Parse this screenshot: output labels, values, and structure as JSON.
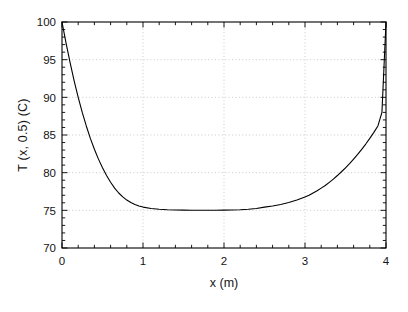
{
  "chart_data": {
    "type": "line",
    "title": "",
    "xlabel": "x (m)",
    "ylabel": "T (x, 0.5) (C)",
    "xlim": [
      0,
      4
    ],
    "ylim": [
      70,
      100
    ],
    "xticks": [
      0,
      1,
      2,
      3,
      4
    ],
    "xtick_labels": [
      "0",
      "1",
      "2",
      "3",
      "4"
    ],
    "yticks": [
      70,
      75,
      80,
      85,
      90,
      95,
      100
    ],
    "ytick_labels": [
      "70",
      "75",
      "80",
      "85",
      "90",
      "95",
      "100"
    ],
    "x_minor_ticks_between": 4,
    "y_minor_ticks_between": 4,
    "grid": true,
    "grid_style": "dotted",
    "grid_color": "#bdbdbd",
    "legend": "none",
    "line_color": "#000000",
    "line_width": 1.1,
    "frame_color": "#000000",
    "background": "#ffffff",
    "series": [
      {
        "name": "T(x, 0.5)",
        "x": [
          0.0,
          0.05,
          0.1,
          0.15,
          0.2,
          0.25,
          0.3,
          0.35,
          0.4,
          0.45,
          0.5,
          0.55,
          0.6,
          0.65,
          0.7,
          0.75,
          0.8,
          0.85,
          0.9,
          0.95,
          1.0,
          1.1,
          1.2,
          1.3,
          1.4,
          1.5,
          1.6,
          1.7,
          1.8,
          1.9,
          2.0,
          2.1,
          2.2,
          2.3,
          2.4,
          2.5,
          2.6,
          2.7,
          2.8,
          2.9,
          3.0,
          3.05,
          3.1,
          3.15,
          3.2,
          3.25,
          3.3,
          3.35,
          3.4,
          3.45,
          3.5,
          3.55,
          3.6,
          3.65,
          3.7,
          3.75,
          3.8,
          3.85,
          3.9,
          3.95,
          4.0
        ],
        "y": [
          100.0,
          97.2,
          94.6,
          92.2,
          90.0,
          88.0,
          86.2,
          84.55,
          83.1,
          81.8,
          80.65,
          79.62,
          78.72,
          77.95,
          77.3,
          76.78,
          76.36,
          76.03,
          75.78,
          75.58,
          75.43,
          75.24,
          75.14,
          75.08,
          75.05,
          75.03,
          75.02,
          75.02,
          75.02,
          75.02,
          75.03,
          75.05,
          75.08,
          75.14,
          75.24,
          75.43,
          75.58,
          75.78,
          76.03,
          76.36,
          76.78,
          77.0,
          77.3,
          77.6,
          77.95,
          78.3,
          78.72,
          79.15,
          79.62,
          80.12,
          80.65,
          81.2,
          81.8,
          82.42,
          83.1,
          83.8,
          84.55,
          85.35,
          86.2,
          88.0,
          100.0
        ]
      }
    ]
  },
  "axes": {
    "x_axis_title": "x (m)",
    "y_axis_title": "T (x, 0.5) (C)"
  }
}
